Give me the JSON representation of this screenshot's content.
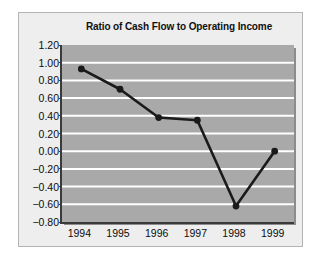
{
  "figure": {
    "title": "Ratio of Cash Flow to Operating Income",
    "panel_bg": "#eeeeee",
    "panel_border": "#b4b4b4",
    "plot_bg": "#a9a9a9",
    "gridline_color": "#ffffff",
    "axis_color": "#3a3a3a",
    "series_color": "#1a1a1a"
  },
  "chart_data": {
    "type": "line",
    "title": "Ratio of Cash Flow to Operating Income",
    "xlabel": "",
    "ylabel": "",
    "categories": [
      "1994",
      "1995",
      "1996",
      "1997",
      "1998",
      "1999"
    ],
    "values": [
      0.93,
      0.7,
      0.38,
      0.35,
      -0.62,
      0.0
    ],
    "series": [
      {
        "name": "Ratio of Cash Flow to Operating Income",
        "values": [
          0.93,
          0.7,
          0.38,
          0.35,
          -0.62,
          0.0
        ]
      }
    ],
    "ylim": [
      -0.8,
      1.2
    ],
    "ytick_step": 0.2,
    "ytick_labels": [
      "1.20",
      "1.00",
      "0.80",
      "0.60",
      "0.40",
      "0.20",
      "0.00",
      "−0.20",
      "−0.40",
      "−0.60",
      "−0.80"
    ],
    "ytick_values": [
      1.2,
      1.0,
      0.8,
      0.6,
      0.4,
      0.2,
      0.0,
      -0.2,
      -0.4,
      -0.6,
      -0.8
    ],
    "xtick_labels": [
      "1994",
      "1995",
      "1996",
      "1997",
      "1998",
      "1999"
    ],
    "grid": "horizontal",
    "markers": "filled-circle",
    "legend": null
  }
}
